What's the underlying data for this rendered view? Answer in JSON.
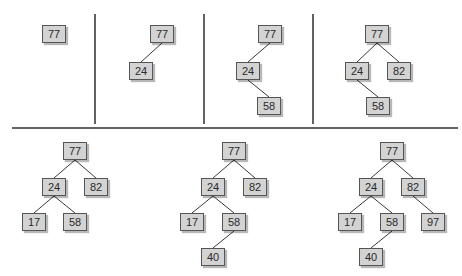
{
  "insertion_order": [
    "77",
    "24",
    "58",
    "82",
    "17",
    "40",
    "97"
  ],
  "colors": {
    "node_fill": "#d3d3d3",
    "node_border": "#555555",
    "edge": "#3a3a3a",
    "divider": "#2e2e2e"
  },
  "panels": [
    {
      "id": "step-1",
      "nodes": [
        {
          "key": "a",
          "label": "77",
          "x": 42,
          "y": 25
        }
      ],
      "edges": []
    },
    {
      "id": "step-2",
      "nodes": [
        {
          "key": "a",
          "label": "77",
          "x": 150,
          "y": 25
        },
        {
          "key": "b",
          "label": "24",
          "x": 129,
          "y": 62
        }
      ],
      "edges": [
        [
          "a",
          "b"
        ]
      ]
    },
    {
      "id": "step-3",
      "nodes": [
        {
          "key": "a",
          "label": "77",
          "x": 258,
          "y": 25
        },
        {
          "key": "b",
          "label": "24",
          "x": 236,
          "y": 62
        },
        {
          "key": "c",
          "label": "58",
          "x": 257,
          "y": 97
        }
      ],
      "edges": [
        [
          "a",
          "b"
        ],
        [
          "b",
          "c"
        ]
      ]
    },
    {
      "id": "step-4",
      "nodes": [
        {
          "key": "a",
          "label": "77",
          "x": 365,
          "y": 25
        },
        {
          "key": "b",
          "label": "24",
          "x": 345,
          "y": 62
        },
        {
          "key": "d",
          "label": "82",
          "x": 387,
          "y": 62
        },
        {
          "key": "c",
          "label": "58",
          "x": 366,
          "y": 97
        }
      ],
      "edges": [
        [
          "a",
          "b"
        ],
        [
          "a",
          "d"
        ],
        [
          "b",
          "c"
        ]
      ]
    },
    {
      "id": "step-5",
      "nodes": [
        {
          "key": "a",
          "label": "77",
          "x": 63,
          "y": 142
        },
        {
          "key": "b",
          "label": "24",
          "x": 42,
          "y": 178
        },
        {
          "key": "d",
          "label": "82",
          "x": 84,
          "y": 178
        },
        {
          "key": "e",
          "label": "17",
          "x": 22,
          "y": 213
        },
        {
          "key": "c",
          "label": "58",
          "x": 63,
          "y": 213
        }
      ],
      "edges": [
        [
          "a",
          "b"
        ],
        [
          "a",
          "d"
        ],
        [
          "b",
          "e"
        ],
        [
          "b",
          "c"
        ]
      ]
    },
    {
      "id": "step-6",
      "nodes": [
        {
          "key": "a",
          "label": "77",
          "x": 222,
          "y": 142
        },
        {
          "key": "b",
          "label": "24",
          "x": 201,
          "y": 178
        },
        {
          "key": "d",
          "label": "82",
          "x": 243,
          "y": 178
        },
        {
          "key": "e",
          "label": "17",
          "x": 180,
          "y": 213
        },
        {
          "key": "c",
          "label": "58",
          "x": 222,
          "y": 213
        },
        {
          "key": "f",
          "label": "40",
          "x": 201,
          "y": 248
        }
      ],
      "edges": [
        [
          "a",
          "b"
        ],
        [
          "a",
          "d"
        ],
        [
          "b",
          "e"
        ],
        [
          "b",
          "c"
        ],
        [
          "c",
          "f"
        ]
      ]
    },
    {
      "id": "step-7",
      "nodes": [
        {
          "key": "a",
          "label": "77",
          "x": 380,
          "y": 142
        },
        {
          "key": "b",
          "label": "24",
          "x": 359,
          "y": 178
        },
        {
          "key": "d",
          "label": "82",
          "x": 401,
          "y": 178
        },
        {
          "key": "e",
          "label": "17",
          "x": 338,
          "y": 213
        },
        {
          "key": "c",
          "label": "58",
          "x": 380,
          "y": 213
        },
        {
          "key": "g",
          "label": "97",
          "x": 421,
          "y": 213
        },
        {
          "key": "f",
          "label": "40",
          "x": 359,
          "y": 248
        }
      ],
      "edges": [
        [
          "a",
          "b"
        ],
        [
          "a",
          "d"
        ],
        [
          "b",
          "e"
        ],
        [
          "b",
          "c"
        ],
        [
          "d",
          "g"
        ],
        [
          "c",
          "f"
        ]
      ]
    }
  ],
  "dividers": {
    "vertical": [
      {
        "x": 95,
        "y1": 14,
        "y2": 124
      },
      {
        "x": 204,
        "y1": 14,
        "y2": 124
      },
      {
        "x": 313,
        "y1": 14,
        "y2": 124
      }
    ],
    "horizontal": [
      {
        "y": 128,
        "x1": 12,
        "x2": 458
      }
    ]
  }
}
